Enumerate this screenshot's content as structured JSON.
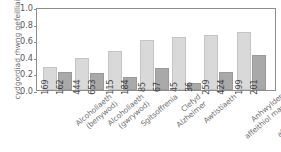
{
  "chart_data": {
    "type": "bar",
    "title": "",
    "subtitle": "",
    "xlabel": "",
    "ylabel": "cydgordiad rhwng gefeilliaid",
    "ylim": [
      0.0,
      1.0
    ],
    "grid": false,
    "legend_position": "none",
    "ytick_labels": [
      "1.0",
      "0.8",
      "0.6",
      "0.4",
      "0.2",
      "0.0"
    ],
    "ytick_values": [
      1.0,
      0.8,
      0.6,
      0.4,
      0.2,
      0.0
    ],
    "categories": [
      "Alcoholiaeth (benywod)",
      "Alcoholiaeth (gwrywod)",
      "Sgitsoffrenia",
      "Clefyd Alzheimer",
      "Awtistiaeth",
      "Anhwylder affeithiol mawr",
      "Anhwylder affeithiol bach"
    ],
    "category_lines": [
      [
        "Alcoholiaeth",
        "(benywod)"
      ],
      [
        "Alcoholiaeth",
        "(gwrywod)"
      ],
      [
        "Sgitsoffrenia",
        ""
      ],
      [
        "Clefyd",
        "Alzheimer"
      ],
      [
        "Awtistiaeth",
        ""
      ],
      [
        "Anhwylder",
        "affeithiol mawr"
      ],
      [
        "Anhwylder",
        "affeithiol bach"
      ]
    ],
    "series": [
      {
        "name": "gefeilliaid unwyaws",
        "color": "#d9d9d9",
        "values": [
          0.28,
          0.38,
          0.47,
          0.6,
          0.64,
          0.665,
          0.695
        ],
        "point_labels": [
          "169",
          "444",
          "115",
          "85",
          "45",
          "259",
          "199"
        ]
      },
      {
        "name": "gefeilliaid deuwyaws",
        "color": "#a9a9a9",
        "values": [
          0.22,
          0.2,
          0.155,
          0.26,
          0.08,
          0.22,
          0.425
        ],
        "point_labels": [
          "162",
          "653",
          "184",
          "67",
          "36",
          "424",
          "201"
        ]
      }
    ]
  },
  "top_sliver": {
    "text": ""
  },
  "colors": {
    "series_a": "#d9d9d9",
    "series_b": "#a9a9a9",
    "axis": "#8d8d8d",
    "text": "#6e6e6e"
  }
}
